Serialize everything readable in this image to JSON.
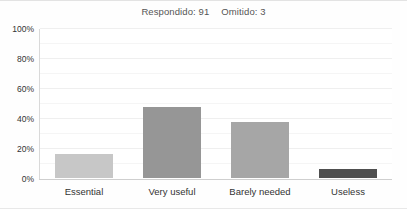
{
  "header": {
    "answered_label": "Respondido: 91",
    "skipped_label": "Omitido: 3"
  },
  "chart_data": {
    "type": "bar",
    "categories": [
      "Essential",
      "Very useful",
      "Barely needed",
      "Useless"
    ],
    "values": [
      17,
      48,
      38,
      7
    ],
    "bar_colors": [
      "#c7c7c7",
      "#969696",
      "#a6a6a6",
      "#4f4f4f"
    ],
    "xlabel": "",
    "ylabel": "",
    "ylim": [
      0,
      100
    ],
    "y_tick_values": [
      0,
      20,
      40,
      60,
      80,
      100
    ],
    "y_tick_labels": [
      "0%",
      "20%",
      "40%",
      "60%",
      "80%",
      "100%"
    ],
    "minor_grid_step": 10,
    "grid": true,
    "legend_position": "none"
  },
  "colors": {
    "bar_light": "#c7c7c7",
    "bar_medium": "#969696",
    "bar_medium_light": "#a6a6a6",
    "bar_dark": "#4f4f4f",
    "axis_line": "#cfcfcf",
    "grid_minor": "#f5f5f5",
    "grid_major": "#efefef",
    "title_text": "#555555",
    "axis_text": "#333333"
  }
}
